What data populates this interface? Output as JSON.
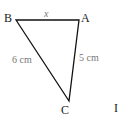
{
  "diagram": {
    "type": "triangle",
    "vertices": [
      {
        "name": "B",
        "x": 16,
        "y": 20
      },
      {
        "name": "A",
        "x": 79,
        "y": 20
      },
      {
        "name": "C",
        "x": 69,
        "y": 101
      }
    ],
    "labels": {
      "B": "B",
      "A": "A",
      "C": "C",
      "side_BA": "x",
      "side_BC": "6 cm",
      "side_AC": "5 cm",
      "extra": "I"
    },
    "colors": {
      "stroke": "#111111",
      "text": "#222222",
      "measure_text": "#777777"
    }
  }
}
